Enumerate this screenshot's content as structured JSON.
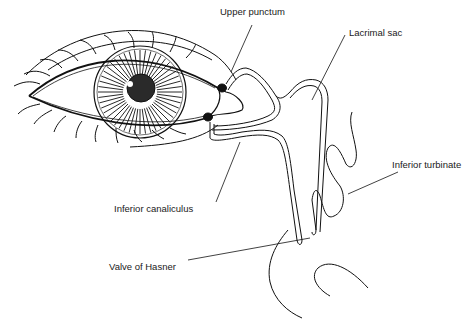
{
  "diagram": {
    "style": "black line drawing on white",
    "colors": {
      "line": "#111111",
      "background": "#ffffff",
      "pupil": "#222222"
    },
    "labels": [
      {
        "id": "upper-punctum",
        "text": "Upper punctum",
        "x": 220,
        "y": 7
      },
      {
        "id": "lacrimal-sac",
        "text": "Lacrimal sac",
        "x": 349,
        "y": 28
      },
      {
        "id": "inferior-turbinate",
        "text": "Inferior turbinate",
        "x": 392,
        "y": 160
      },
      {
        "id": "inferior-canaliculus",
        "text": "Inferior canaliculus",
        "x": 114,
        "y": 204
      },
      {
        "id": "valve-of-hasner",
        "text": "Valve of Hasner",
        "x": 109,
        "y": 262
      }
    ],
    "structures": [
      "eye",
      "iris",
      "pupil",
      "eyelids",
      "eyelashes",
      "upper punctum",
      "lower punctum",
      "canaliculi",
      "lacrimal sac",
      "nasolacrimal duct",
      "inferior turbinate",
      "nasal floor"
    ]
  }
}
